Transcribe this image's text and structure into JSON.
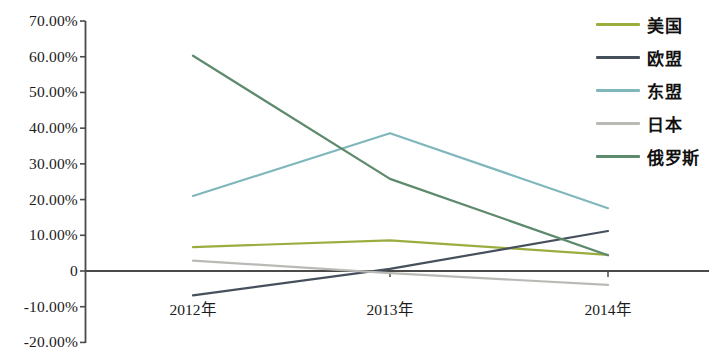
{
  "chart_data": {
    "type": "line",
    "title": "",
    "subtitle": "",
    "xlabel": "",
    "ylabel": "",
    "categories": [
      "2012年",
      "2013年",
      "2014年"
    ],
    "x_tick_labels": [
      "2012年",
      "2013年",
      "2014年"
    ],
    "y_tick_labels": [
      "70.00%",
      "60.00%",
      "50.00%",
      "40.00%",
      "30.00%",
      "20.00%",
      "10.00%",
      "0",
      "-10.00%",
      "-20.00%"
    ],
    "y_tick_values": [
      70,
      60,
      50,
      40,
      30,
      20,
      10,
      0,
      -10,
      -20
    ],
    "ylim": [
      -20,
      70
    ],
    "yunit": "%",
    "grid": false,
    "legend_position": "right",
    "series": [
      {
        "name": "美国",
        "color": "#9aad3e",
        "values": [
          6.7,
          8.6,
          4.5
        ]
      },
      {
        "name": "欧盟",
        "color": "#46505c",
        "values": [
          -6.8,
          0.6,
          11.2
        ]
      },
      {
        "name": "东盟",
        "color": "#7fb7bd",
        "values": [
          21.0,
          38.6,
          17.6
        ]
      },
      {
        "name": "日本",
        "color": "#b9bab6",
        "values": [
          2.9,
          -0.6,
          -3.9
        ]
      },
      {
        "name": "俄罗斯",
        "color": "#5d8a6c",
        "values": [
          60.3,
          25.8,
          4.4
        ]
      }
    ]
  },
  "legend": {
    "items": [
      {
        "label": "美国"
      },
      {
        "label": "欧盟"
      },
      {
        "label": "东盟"
      },
      {
        "label": "日本"
      },
      {
        "label": "俄罗斯"
      }
    ]
  },
  "axis": {
    "zero_label": "0"
  }
}
